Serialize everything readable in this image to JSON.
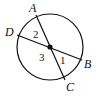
{
  "diagram": {
    "type": "circle-with-intersecting-chords",
    "circle": {
      "cx": 50,
      "cy": 47,
      "r": 33
    },
    "center_point": {
      "x": 50,
      "y": 47
    },
    "points": {
      "A": {
        "label": "A",
        "x": 36,
        "y": 15,
        "label_x": 29,
        "label_y": 12
      },
      "B": {
        "label": "B",
        "x": 82,
        "y": 60,
        "label_x": 84,
        "label_y": 68
      },
      "C": {
        "label": "C",
        "x": 65,
        "y": 80,
        "label_x": 66,
        "label_y": 91
      },
      "D": {
        "label": "D",
        "x": 17,
        "y": 35,
        "label_x": 5,
        "label_y": 36
      }
    },
    "segments": [
      {
        "from": "A",
        "to": "C"
      },
      {
        "from": "D",
        "to": "B"
      }
    ],
    "angles": [
      {
        "label": "1",
        "x": 60,
        "y": 64
      },
      {
        "label": "2",
        "x": 33,
        "y": 38
      },
      {
        "label": "3",
        "x": 39,
        "y": 61
      }
    ],
    "stroke_color": "#111111"
  }
}
